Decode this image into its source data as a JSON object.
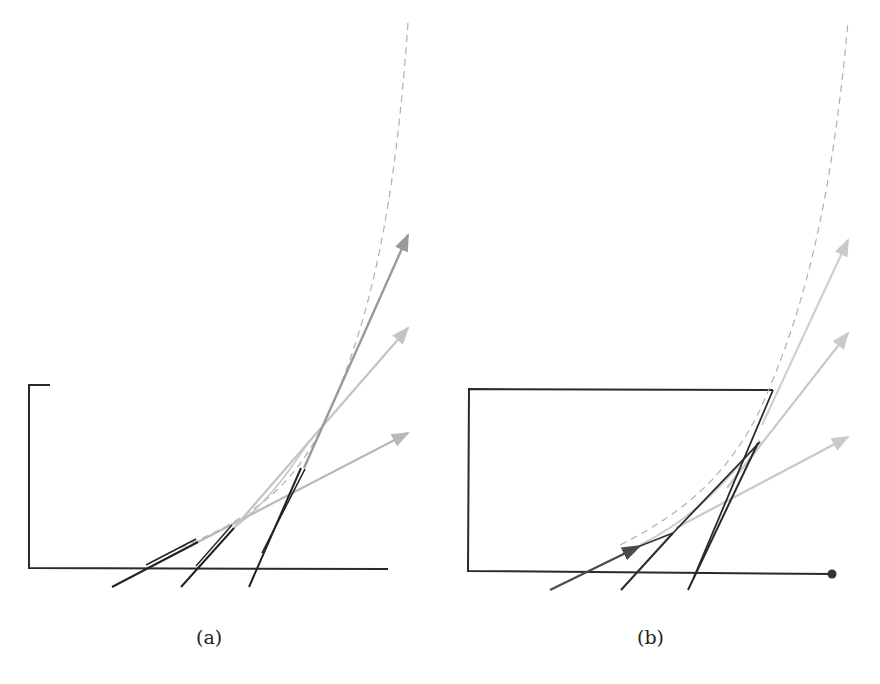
{
  "figure": {
    "panels": [
      {
        "id": "a",
        "caption": "(a)",
        "boundary": "open-bracket",
        "tangent_arrows": [
          {
            "color": "#b8b8b8",
            "role": "shallow-tangent"
          },
          {
            "color": "#c4c4c4",
            "role": "middle-tangent"
          },
          {
            "color": "#9a9a9a",
            "role": "steep-tangent"
          }
        ],
        "dark_segments": 3,
        "curve_style": "dashed"
      },
      {
        "id": "b",
        "caption": "(b)",
        "boundary": "rectangle-with-endpoint-dot",
        "tangent_arrows": [
          {
            "color": "#c8c8c8",
            "role": "shallow-tangent"
          },
          {
            "color": "#c8c8c8",
            "role": "middle-tangent"
          },
          {
            "color": "#cfcfcf",
            "role": "steep-tangent"
          }
        ],
        "dark_segments": 3,
        "curve_style": "dashed"
      }
    ],
    "colors": {
      "ink": "#2a2a2a",
      "dark_arrow": "#4a4a4a",
      "dashed_curve": "#b0b0b0"
    }
  }
}
